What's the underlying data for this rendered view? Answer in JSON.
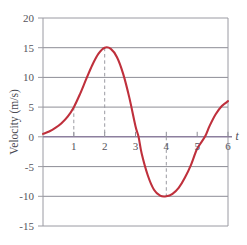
{
  "chart_data": {
    "type": "line",
    "title": "",
    "subtitle": "",
    "xlabel": "t",
    "ylabel": "Velocity (m/s)",
    "xlim": [
      0,
      6
    ],
    "ylim": [
      -15,
      20
    ],
    "grid": true,
    "grid_orientation": "horizontal",
    "legend": false,
    "legend_position": "none",
    "x_ticks": [
      1,
      2,
      3,
      4,
      5,
      6
    ],
    "x_tick_labels": [
      "1",
      "2",
      "3",
      "4",
      "5",
      "6"
    ],
    "y_ticks": [
      20,
      15,
      10,
      5,
      0,
      -5,
      -10,
      -15
    ],
    "y_tick_labels": [
      "20",
      "15",
      "10",
      "5",
      "0",
      "-5",
      "-10",
      "-15"
    ],
    "series": [
      {
        "name": "velocity",
        "color": "#bf303c",
        "points": [
          [
            0.0,
            0.5
          ],
          [
            0.2,
            0.9
          ],
          [
            0.4,
            1.5
          ],
          [
            0.6,
            2.3
          ],
          [
            0.8,
            3.4
          ],
          [
            1.0,
            5.0
          ],
          [
            1.2,
            7.2
          ],
          [
            1.4,
            9.7
          ],
          [
            1.6,
            12.1
          ],
          [
            1.8,
            14.0
          ],
          [
            2.0,
            15.0
          ],
          [
            2.2,
            14.8
          ],
          [
            2.4,
            13.4
          ],
          [
            2.6,
            10.6
          ],
          [
            2.8,
            6.6
          ],
          [
            3.0,
            1.8
          ],
          [
            3.1,
            0.0
          ],
          [
            3.2,
            -2.8
          ],
          [
            3.4,
            -6.5
          ],
          [
            3.6,
            -8.9
          ],
          [
            3.8,
            -9.9
          ],
          [
            4.0,
            -10.0
          ],
          [
            4.2,
            -9.6
          ],
          [
            4.4,
            -8.6
          ],
          [
            4.6,
            -6.9
          ],
          [
            4.8,
            -4.7
          ],
          [
            5.0,
            -2.0
          ],
          [
            5.25,
            0.0
          ],
          [
            5.4,
            1.8
          ],
          [
            5.6,
            3.8
          ],
          [
            5.8,
            5.2
          ],
          [
            6.0,
            6.0
          ]
        ]
      }
    ],
    "annotations": [
      {
        "type": "dashed-guide",
        "label": "guide-t1",
        "x": 1,
        "y_from": 0,
        "y_to": 5
      },
      {
        "type": "dashed-guide",
        "label": "guide-t2-peak",
        "x": 2,
        "y_from": 0,
        "y_to": 15
      },
      {
        "type": "dashed-guide",
        "label": "guide-t4-trough",
        "x": 4,
        "y_from": 0,
        "y_to": -10
      }
    ],
    "key_values": {
      "start_value": 0.5,
      "maximum": {
        "t": 2,
        "v": 15
      },
      "minimum": {
        "t": 4,
        "v": -10
      },
      "zero_crossings": [
        3.1,
        5.25
      ],
      "end_value": 6.0
    },
    "colors": {
      "curve": "#bf303c",
      "gridline": "#8d8d96",
      "frame": "#9a9aa2",
      "zero_axis": "#8c7f9e",
      "text": "#55555c",
      "dashed_guide": "#9a9aa2",
      "background": "#ffffff"
    }
  }
}
